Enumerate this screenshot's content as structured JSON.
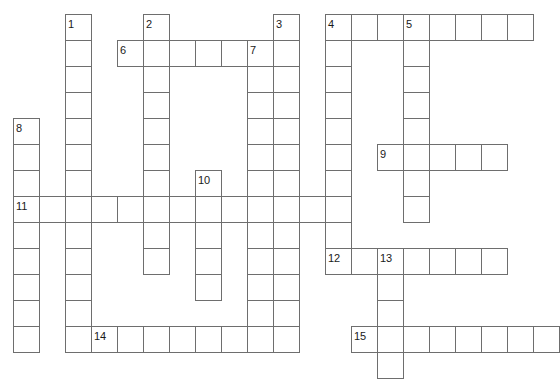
{
  "puzzle": {
    "type": "crossword-grid",
    "title": "",
    "grid": {
      "cell_size": 26,
      "origin_x": 13,
      "origin_y": 14,
      "cols": 20,
      "rows": 14,
      "border_color": "#6e6e6e",
      "cell_fill": "#ffffff",
      "background": "#ffffff"
    },
    "entries": [
      {
        "number": "1",
        "direction": "down",
        "row": 0,
        "col": 2,
        "length": 13
      },
      {
        "number": "2",
        "direction": "down",
        "row": 0,
        "col": 5,
        "length": 10
      },
      {
        "number": "3",
        "direction": "down",
        "row": 0,
        "col": 10,
        "length": 13
      },
      {
        "number": "4",
        "direction": "across",
        "row": 0,
        "col": 12,
        "length": 8
      },
      {
        "number": "4",
        "direction": "down",
        "row": 0,
        "col": 12,
        "length": 10
      },
      {
        "number": "5",
        "direction": "down",
        "row": 0,
        "col": 15,
        "length": 8
      },
      {
        "number": "6",
        "direction": "across",
        "row": 1,
        "col": 4,
        "length": 6
      },
      {
        "number": "7",
        "direction": "down",
        "row": 1,
        "col": 9,
        "length": 11
      },
      {
        "number": "8",
        "direction": "down",
        "row": 4,
        "col": 0,
        "length": 9
      },
      {
        "number": "9",
        "direction": "across",
        "row": 5,
        "col": 14,
        "length": 5
      },
      {
        "number": "10",
        "direction": "down",
        "row": 6,
        "col": 7,
        "length": 5
      },
      {
        "number": "11",
        "direction": "across",
        "row": 7,
        "col": 0,
        "length": 13
      },
      {
        "number": "12",
        "direction": "across",
        "row": 9,
        "col": 12,
        "length": 7
      },
      {
        "number": "13",
        "direction": "down",
        "row": 9,
        "col": 14,
        "length": 5
      },
      {
        "number": "14",
        "direction": "across",
        "row": 12,
        "col": 3,
        "length": 7
      },
      {
        "number": "15",
        "direction": "across",
        "row": 12,
        "col": 13,
        "length": 8
      }
    ],
    "numbers": [
      {
        "label": "1",
        "row": 0,
        "col": 2
      },
      {
        "label": "2",
        "row": 0,
        "col": 5
      },
      {
        "label": "3",
        "row": 0,
        "col": 10
      },
      {
        "label": "4",
        "row": 0,
        "col": 12
      },
      {
        "label": "5",
        "row": 0,
        "col": 15
      },
      {
        "label": "6",
        "row": 1,
        "col": 4
      },
      {
        "label": "7",
        "row": 1,
        "col": 9
      },
      {
        "label": "8",
        "row": 4,
        "col": 0
      },
      {
        "label": "9",
        "row": 5,
        "col": 14
      },
      {
        "label": "10",
        "row": 6,
        "col": 7
      },
      {
        "label": "11",
        "row": 7,
        "col": 0
      },
      {
        "label": "12",
        "row": 9,
        "col": 12
      },
      {
        "label": "13",
        "row": 9,
        "col": 14
      },
      {
        "label": "14",
        "row": 12,
        "col": 3
      },
      {
        "label": "15",
        "row": 12,
        "col": 13
      }
    ]
  }
}
